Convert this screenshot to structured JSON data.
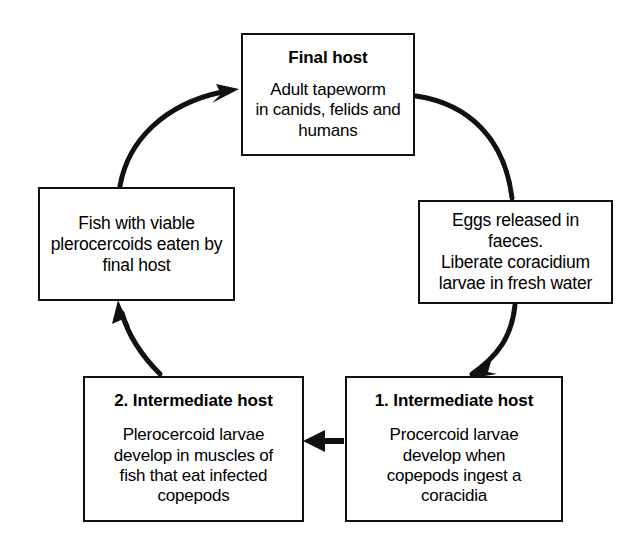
{
  "diagram": {
    "type": "life-cycle-flow-diagram",
    "background_color": "#ffffff",
    "line_color": "#111111",
    "nodes": [
      {
        "id": "final_host",
        "title": "Final host",
        "body": "Adult tapeworm\nin canids, felids and\nhumans"
      },
      {
        "id": "eggs",
        "title": "",
        "body": "Eggs released in faeces.\nLiberate coracidium\nlarvae in fresh water"
      },
      {
        "id": "intermediate_host_1",
        "title": "1. Intermediate host",
        "body": "Procercoid larvae\ndevelop when\ncopepods ingest a\ncoracidia"
      },
      {
        "id": "intermediate_host_2",
        "title": "2. Intermediate host",
        "body": "Plerocercoid larvae\ndevelop in muscles of\nfish that eat infected\ncopepods"
      },
      {
        "id": "fish",
        "title": "",
        "body": "Fish with viable\nplerocercoids eaten by\nfinal host"
      }
    ],
    "connectors": [
      {
        "id": "final_host_to_eggs",
        "from": "final_host",
        "to": "eggs",
        "style": "curved",
        "arrowhead": false
      },
      {
        "id": "eggs_to_int1",
        "from": "eggs",
        "to": "intermediate_host_1",
        "style": "curved",
        "arrowhead": true
      },
      {
        "id": "int1_to_int2",
        "from": "intermediate_host_1",
        "to": "intermediate_host_2",
        "style": "straight",
        "arrowhead": true
      },
      {
        "id": "int2_to_fish",
        "from": "intermediate_host_2",
        "to": "fish",
        "style": "curved",
        "arrowhead": true
      },
      {
        "id": "fish_to_final_host",
        "from": "fish",
        "to": "final_host",
        "style": "curved",
        "arrowhead": true
      }
    ]
  }
}
